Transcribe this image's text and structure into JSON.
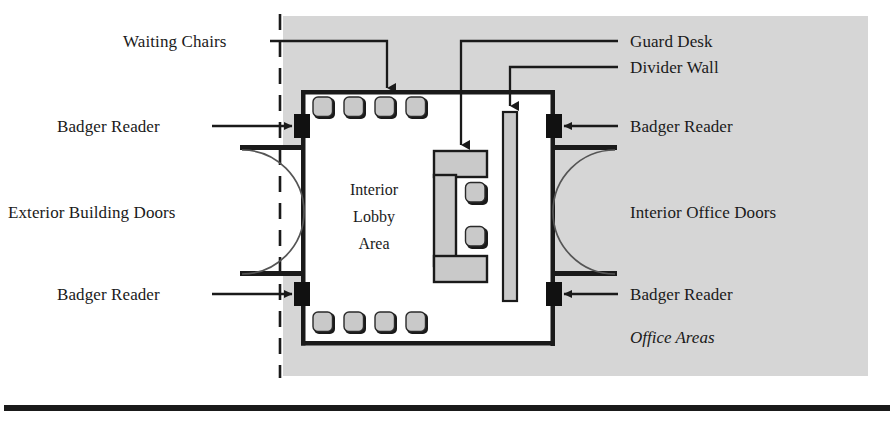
{
  "figure": {
    "type": "floor-plan-diagram",
    "colors": {
      "ink": "#1a1a1a",
      "paper": "#ffffff",
      "secure_zone_fill": "#d4d4d4",
      "furniture_fill": "#c9c9c9",
      "badge_reader_fill": "#111111"
    }
  },
  "labels": {
    "waiting_chairs": "Waiting Chairs",
    "badge_reader_top_left": "Badger Reader",
    "badge_reader_bottom_left": "Badger Reader",
    "exterior_building_doors": "Exterior Building Doors",
    "guard_desk": "Guard Desk",
    "divider_wall": "Divider Wall",
    "badge_reader_top_right": "Badger Reader",
    "badge_reader_bottom_right": "Badger Reader",
    "interior_office_doors": "Interior Office Doors",
    "office_areas": "Office Areas"
  },
  "lobby": {
    "line1": "Interior",
    "line2": "Lobby",
    "line3": "Area"
  },
  "elements": {
    "waiting_chairs_top_count": 4,
    "waiting_chairs_bottom_count": 4,
    "guard_desk_chairs_count": 2,
    "badge_readers_count": 4,
    "door_swings_count": 4,
    "divider_walls_count": 1
  }
}
